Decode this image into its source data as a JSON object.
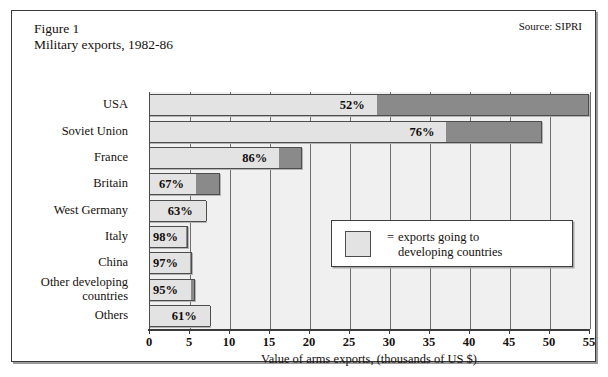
{
  "figure": {
    "title": "Figure 1",
    "subtitle": "Military exports, 1982-86",
    "source": "Source: SIPRI"
  },
  "legend": {
    "equals": "=",
    "text": "exports going to\ndeveloping countries",
    "swatch_color": "#e3e3e3"
  },
  "colors": {
    "developing_segment": "#e3e3e3",
    "other_segment": "#8a8a8a",
    "plot_background": "#f0f0f0",
    "gridline": "#6e6e6e",
    "border": "#4d4d4d",
    "text": "#16100d"
  },
  "chart_data": {
    "type": "bar",
    "orientation": "horizontal",
    "stacked": true,
    "title": "Military exports, 1982-86",
    "xlabel": "Value of arms exports, (thousands of US $)",
    "ylabel": "",
    "xlim": [
      0,
      55
    ],
    "xticks": [
      0,
      5,
      10,
      15,
      20,
      25,
      30,
      35,
      40,
      45,
      50,
      55
    ],
    "grid": true,
    "legend_position": "inside-center-right",
    "categories": [
      "USA",
      "Soviet Union",
      "France",
      "Britain",
      "West Germany",
      "Italy",
      "China",
      "Other developing\ncountries",
      "Others"
    ],
    "series": [
      {
        "name": "exports going to developing countries",
        "color": "#e3e3e3",
        "values": [
          28.6,
          37.3,
          16.4,
          6.0,
          7.1,
          4.8,
          5.2,
          5.4,
          7.6
        ]
      },
      {
        "name": "other exports",
        "color": "#8a8a8a",
        "values": [
          26.4,
          11.8,
          2.7,
          2.9,
          0.0,
          0.1,
          0.2,
          0.3,
          0.0
        ]
      }
    ],
    "totals": [
      55.0,
      49.1,
      19.1,
      8.9,
      7.1,
      4.9,
      5.4,
      5.7,
      7.6
    ],
    "labels": [
      "52%",
      "76%",
      "86%",
      "67%",
      "63%",
      "98%",
      "97%",
      "95%",
      "61%"
    ],
    "label_note": "percentage of each country's arms exports going to developing countries"
  }
}
